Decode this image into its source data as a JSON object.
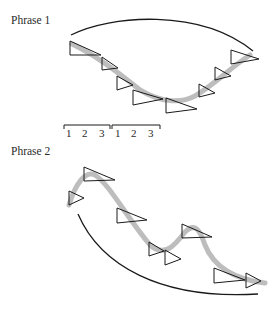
{
  "phrase1": {
    "label": "Phrase 1",
    "label_pos": [
      11,
      14
    ],
    "arc": "M 71 35 C 110 15, 200 8, 253 51",
    "contour": "M 72 44 C 95 55, 115 70, 140 90 C 160 102, 180 104, 195 96 C 215 84, 230 68, 250 55",
    "triangles": [
      [
        70,
        41,
        14,
        15,
        31
      ],
      [
        102,
        57,
        13,
        11,
        16
      ],
      [
        117,
        76,
        14,
        9,
        16
      ],
      [
        133,
        90,
        15,
        9,
        30
      ],
      [
        166,
        98,
        15,
        11,
        31
      ],
      [
        199,
        84,
        13,
        9,
        16
      ],
      [
        215,
        67,
        13,
        9,
        16
      ],
      [
        231,
        50,
        14,
        9,
        28
      ]
    ],
    "brackets": [
      {
        "x1": 64,
        "x2": 110,
        "y": 125
      },
      {
        "x1": 112,
        "x2": 160,
        "y": 125
      }
    ],
    "beats": [
      {
        "text": "1",
        "x": 66
      },
      {
        "text": "2",
        "x": 82
      },
      {
        "text": "3",
        "x": 99
      },
      {
        "text": "1",
        "x": 115
      },
      {
        "text": "2",
        "x": 131
      },
      {
        "text": "3",
        "x": 148
      }
    ],
    "beats_y": 127
  },
  "phrase2": {
    "label": "Phrase 2",
    "label_pos": [
      11,
      145
    ],
    "arc": "M 78 214 C 100 265, 160 300, 258 294",
    "contour": "M 69 205 C 75 185, 85 170, 95 175 C 110 185, 125 215, 150 245 C 165 258, 175 245, 185 232 C 195 222, 200 230, 205 245 C 215 270, 240 280, 265 283",
    "triangles": [
      [
        69,
        191,
        14,
        7,
        15
      ],
      [
        84,
        167,
        14,
        13,
        31
      ],
      [
        117,
        208,
        15,
        12,
        30
      ],
      [
        149,
        242,
        14,
        9,
        15
      ],
      [
        165,
        250,
        15,
        9,
        16
      ],
      [
        182,
        224,
        14,
        13,
        30
      ],
      [
        214,
        268,
        15,
        12,
        31
      ],
      [
        246,
        273,
        15,
        8,
        15
      ]
    ]
  },
  "colors": {
    "ink": "#1a1a1a",
    "contour": "#bdbdbd",
    "background": "#ffffff"
  }
}
